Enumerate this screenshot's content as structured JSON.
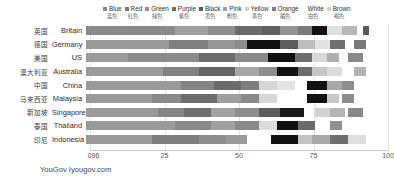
{
  "source_note": "YouGov Iyougov.com",
  "legend": {
    "items": [
      {
        "label": "Blue",
        "label_zh": "蓝色",
        "color": "#8a8a8a",
        "swatch": true
      },
      {
        "label": "Red",
        "label_zh": "红色",
        "color": "#797979",
        "swatch": true
      },
      {
        "label": "Green",
        "label_zh": "绿色",
        "color": "#909090",
        "swatch": true
      },
      {
        "label": "Purple",
        "label_zh": "紫色",
        "color": "#6d6d6d",
        "swatch": true
      },
      {
        "label": "Black",
        "label_zh": "黑色",
        "color": "#5a5a5a",
        "swatch": true
      },
      {
        "label": "Pink",
        "label_zh": "粉色",
        "color": "#a3a3a3",
        "swatch": true
      },
      {
        "label": "Yellow",
        "label_zh": "黄色",
        "color": "#d2d2d2",
        "swatch": true
      },
      {
        "label": "Orange",
        "label_zh": "橘色",
        "color": "#7f7f7f",
        "swatch": true
      },
      {
        "label": "White",
        "label_zh": "白色",
        "color": "#111111",
        "swatch": false
      },
      {
        "label": "Brown",
        "label_zh": "褐色",
        "color": "#cfcfcf",
        "swatch": true
      }
    ]
  },
  "axis": {
    "ticks": [
      "096",
      "25",
      "50",
      "75",
      "100"
    ],
    "tick_values": [
      0,
      25,
      50,
      75,
      100
    ],
    "min": 0,
    "max": 100
  },
  "chart_data": {
    "type": "bar",
    "orientation": "horizontal",
    "stacked": true,
    "title": "",
    "subtitle": "",
    "xlabel": "",
    "ylabel": "",
    "xlim": [
      0,
      100
    ],
    "grid": false,
    "legend_position": "top-right",
    "annotation": "YouGov Iyougov.com",
    "categories": [
      "Britain",
      "Germany",
      "US",
      "Australia",
      "China",
      "Malaysia",
      "Singapore",
      "Thailand",
      "Indonesia"
    ],
    "categories_zh": [
      "英国",
      "德国",
      "美国",
      "澳大利亚",
      "中国",
      "马来西亚",
      "新加坡",
      "泰国",
      "印尼"
    ],
    "series": [
      {
        "name": "Blue",
        "color": "#8a8a8a",
        "values": [
          33,
          31,
          27,
          30,
          23,
          19,
          21,
          22,
          22
        ]
      },
      {
        "name": "Red",
        "color": "#797979",
        "values": [
          9,
          11,
          9,
          9,
          9,
          12,
          10,
          12,
          15
        ]
      },
      {
        "name": "Green",
        "color": "#909090",
        "values": [
          8,
          8,
          11,
          9,
          11,
          11,
          9,
          8,
          9
        ]
      },
      {
        "name": "Purple",
        "color": "#6d6d6d",
        "values": [
          6,
          5,
          6,
          6,
          8,
          9,
          7,
          6,
          6
        ]
      },
      {
        "name": "Black",
        "color": "#5a5a5a",
        "values": [
          6,
          7,
          7,
          6,
          5,
          6,
          10,
          6,
          0
        ]
      },
      {
        "name": "Pink",
        "color": "#a3a3a3",
        "values": [
          6,
          4,
          5,
          5,
          5,
          5,
          5,
          5,
          0
        ]
      },
      {
        "name": "Yellow",
        "color": "#d2d2d2",
        "values": [
          4,
          4,
          4,
          4,
          5,
          4,
          4,
          5,
          0
        ]
      },
      {
        "name": "Orange",
        "color": "#7f7f7f",
        "values": [
          4,
          5,
          5,
          4,
          0,
          0,
          0,
          5,
          0
        ]
      },
      {
        "name": "White",
        "color": "#111111",
        "values": [
          5,
          5,
          6,
          5,
          6,
          6,
          6,
          6,
          7
        ]
      },
      {
        "name": "Brown",
        "color": "#cfcfcf",
        "values": [
          4,
          3,
          3,
          4,
          4,
          3,
          3,
          4,
          4
        ]
      }
    ]
  },
  "bars": {
    "rows": [
      {
        "segments": [
          {
            "x": 0,
            "w": 30,
            "c": "#8a8a8a"
          },
          {
            "x": 30,
            "w": 11,
            "c": "#a0a0a0"
          },
          {
            "x": 41,
            "w": 9,
            "c": "#8e8e8e"
          },
          {
            "x": 50,
            "w": 9,
            "c": "#6a6a6a"
          },
          {
            "x": 59,
            "w": 6,
            "c": "#5f5f5f"
          },
          {
            "x": 65,
            "w": 6,
            "c": "#949494"
          },
          {
            "x": 71,
            "w": 5,
            "c": "#7b7b7b"
          },
          {
            "x": 76,
            "w": 5,
            "c": "#111111"
          },
          {
            "x": 81,
            "w": 5,
            "c": "#e0e0e0"
          },
          {
            "x": 86,
            "w": 5,
            "c": "#b8b8b8"
          },
          {
            "x": 93,
            "w": 2,
            "c": "#5a5a5a"
          }
        ]
      },
      {
        "segments": [
          {
            "x": 0,
            "w": 28,
            "c": "#9a9a9a"
          },
          {
            "x": 28,
            "w": 13,
            "c": "#808080"
          },
          {
            "x": 41,
            "w": 9,
            "c": "#969696"
          },
          {
            "x": 50,
            "w": 4,
            "c": "#8c8c8c"
          },
          {
            "x": 54,
            "w": 11,
            "c": "#111111"
          },
          {
            "x": 65,
            "w": 6,
            "c": "#5e5e5e"
          },
          {
            "x": 71,
            "w": 6,
            "c": "#bdbdbd"
          },
          {
            "x": 77,
            "w": 5,
            "c": "#e2e2e2"
          },
          {
            "x": 82,
            "w": 5,
            "c": "#6f6f6f"
          },
          {
            "x": 90,
            "w": 4,
            "c": "#7a7a7a"
          }
        ]
      },
      {
        "segments": [
          {
            "x": 0,
            "w": 14,
            "c": "#9b9b9b"
          },
          {
            "x": 14,
            "w": 24,
            "c": "#8c8c8c"
          },
          {
            "x": 38,
            "w": 12,
            "c": "#6c6c6c"
          },
          {
            "x": 50,
            "w": 11,
            "c": "#8a8a8a"
          },
          {
            "x": 61,
            "w": 9,
            "c": "#111111"
          },
          {
            "x": 70,
            "w": 6,
            "c": "#6e6e6e"
          },
          {
            "x": 76,
            "w": 5,
            "c": "#d8d8d8"
          },
          {
            "x": 81,
            "w": 4,
            "c": "#b0b0b0"
          },
          {
            "x": 88,
            "w": 5,
            "c": "#8a8a8a"
          }
        ]
      },
      {
        "segments": [
          {
            "x": 0,
            "w": 26,
            "c": "#9a9a9a"
          },
          {
            "x": 26,
            "w": 12,
            "c": "#838383"
          },
          {
            "x": 38,
            "w": 12,
            "c": "#636363"
          },
          {
            "x": 50,
            "w": 8,
            "c": "#a6a6a6"
          },
          {
            "x": 58,
            "w": 6,
            "c": "#8e8e8e"
          },
          {
            "x": 64,
            "w": 7,
            "c": "#111111"
          },
          {
            "x": 71,
            "w": 5,
            "c": "#6b6b6b"
          },
          {
            "x": 76,
            "w": 5,
            "c": "#c6c6c6"
          },
          {
            "x": 81,
            "w": 5,
            "c": "#dcdcdc"
          },
          {
            "x": 90,
            "w": 4,
            "c": "#b5b5b5"
          }
        ]
      },
      {
        "segments": [
          {
            "x": 0,
            "w": 32,
            "c": "#9a9a9a"
          },
          {
            "x": 32,
            "w": 11,
            "c": "#848484"
          },
          {
            "x": 43,
            "w": 9,
            "c": "#6b6b6b"
          },
          {
            "x": 52,
            "w": 6,
            "c": "#7e7e7e"
          },
          {
            "x": 58,
            "w": 6,
            "c": "#d6d6d6"
          },
          {
            "x": 64,
            "w": 6,
            "c": "#e4e4e4"
          },
          {
            "x": 74,
            "w": 7,
            "c": "#111111"
          },
          {
            "x": 81,
            "w": 5,
            "c": "#a8a8a8"
          },
          {
            "x": 86,
            "w": 4,
            "c": "#8e8e8e"
          }
        ]
      },
      {
        "segments": [
          {
            "x": 0,
            "w": 22,
            "c": "#9a9a9a"
          },
          {
            "x": 22,
            "w": 10,
            "c": "#8a8a8a"
          },
          {
            "x": 32,
            "w": 12,
            "c": "#6c6c6c"
          },
          {
            "x": 44,
            "w": 8,
            "c": "#9e9e9e"
          },
          {
            "x": 52,
            "w": 6,
            "c": "#8a8a8a"
          },
          {
            "x": 58,
            "w": 6,
            "c": "#d8d8d8"
          },
          {
            "x": 74,
            "w": 7,
            "c": "#111111"
          },
          {
            "x": 81,
            "w": 4,
            "c": "#c8c8c8"
          },
          {
            "x": 86,
            "w": 4,
            "c": "#8c8c8c"
          }
        ]
      },
      {
        "segments": [
          {
            "x": 0,
            "w": 24,
            "c": "#9a9a9a"
          },
          {
            "x": 24,
            "w": 9,
            "c": "#858585"
          },
          {
            "x": 33,
            "w": 9,
            "c": "#6e6e6e"
          },
          {
            "x": 42,
            "w": 8,
            "c": "#a2a2a2"
          },
          {
            "x": 50,
            "w": 8,
            "c": "#8e8e8e"
          },
          {
            "x": 58,
            "w": 7,
            "c": "#5c5c5c"
          },
          {
            "x": 65,
            "w": 8,
            "c": "#1a1a1a"
          },
          {
            "x": 77,
            "w": 5,
            "c": "#d2d2d2"
          },
          {
            "x": 82,
            "w": 5,
            "c": "#b6b6b6"
          },
          {
            "x": 88,
            "w": 5,
            "c": "#8a8a8a"
          }
        ]
      },
      {
        "segments": [
          {
            "x": 0,
            "w": 30,
            "c": "#9a9a9a"
          },
          {
            "x": 30,
            "w": 12,
            "c": "#8a8a8a"
          },
          {
            "x": 42,
            "w": 8,
            "c": "#a0a0a0"
          },
          {
            "x": 50,
            "w": 8,
            "c": "#8a8a8a"
          },
          {
            "x": 58,
            "w": 6,
            "c": "#dcdcdc"
          },
          {
            "x": 64,
            "w": 7,
            "c": "#111111"
          },
          {
            "x": 71,
            "w": 6,
            "c": "#6a6a6a"
          },
          {
            "x": 82,
            "w": 4,
            "c": "#909090"
          }
        ]
      },
      {
        "segments": [
          {
            "x": 0,
            "w": 22,
            "c": "#9a9a9a"
          },
          {
            "x": 22,
            "w": 16,
            "c": "#7e7e7e"
          },
          {
            "x": 38,
            "w": 9,
            "c": "#8e8e8e"
          },
          {
            "x": 47,
            "w": 7,
            "c": "#9a9a9a"
          },
          {
            "x": 62,
            "w": 9,
            "c": "#111111"
          },
          {
            "x": 71,
            "w": 5,
            "c": "#c4c4c4"
          },
          {
            "x": 76,
            "w": 6,
            "c": "#a8a8a8"
          },
          {
            "x": 82,
            "w": 6,
            "c": "#6e6e6e"
          },
          {
            "x": 88,
            "w": 6,
            "c": "#dedede"
          }
        ]
      }
    ]
  }
}
